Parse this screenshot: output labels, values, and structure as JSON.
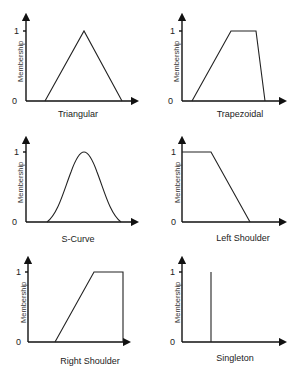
{
  "figure": {
    "y_axis_label": "Membership",
    "y_tick_low": "0",
    "y_tick_high": "1",
    "panels": [
      {
        "name": "Triangular",
        "caption": "Triangular"
      },
      {
        "name": "Trapezoidal",
        "caption": "Trapezoidal"
      },
      {
        "name": "S-Curve",
        "caption": "S-Curve"
      },
      {
        "name": "Left Shoulder",
        "caption": "Left Shoulder"
      },
      {
        "name": "Right Shoulder",
        "caption": "Right Shoulder"
      },
      {
        "name": "Singleton",
        "caption": "Singleton"
      }
    ]
  },
  "colors": {
    "line": "#222222",
    "background": "#ffffff"
  }
}
